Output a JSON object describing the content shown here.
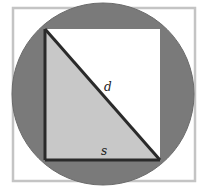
{
  "diagram": {
    "labels": {
      "diagonal": "d",
      "side": "s"
    },
    "colors": {
      "frame": "#c4c4c4",
      "circle_fill": "#7a7a7a",
      "square_fill": "#ffffff",
      "triangle_fill": "#c8c8c8",
      "edge": "#2a2a2a"
    }
  }
}
